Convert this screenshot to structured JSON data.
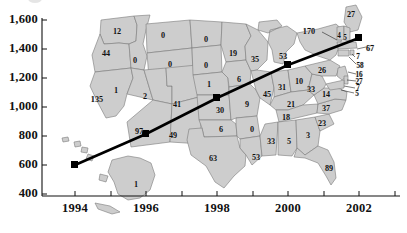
{
  "chart_data": {
    "type": "line",
    "title": "",
    "xlabel": "",
    "ylabel": "",
    "xlim": [
      1993.2,
      2003.0
    ],
    "ylim": [
      400,
      1600
    ],
    "xticks": [
      "1994",
      "1996",
      "1998",
      "2000",
      "2002"
    ],
    "xtick_values": [
      1994,
      1996,
      1998,
      2000,
      2002
    ],
    "yticks": [
      "400",
      "600",
      "800",
      "1,000",
      "1,200",
      "1,400",
      "1,600"
    ],
    "ytick_values": [
      400,
      600,
      800,
      1000,
      1200,
      1400,
      1600
    ],
    "minor_xticks": [
      1995,
      1997,
      1999,
      2001
    ],
    "grid": false,
    "legend": null,
    "marker": "filled-square",
    "line_color": "#000000",
    "series": [
      {
        "name": "trend",
        "x": [
          1994,
          1996,
          1998,
          2000,
          2002
        ],
        "values": [
          600,
          880,
          1140,
          1350,
          1510
        ]
      }
    ],
    "background_map": {
      "type": "choropleth-annotation",
      "region": "United States",
      "fill_color": "#cdcdcd",
      "border_color": "#7a7a7a",
      "state_values": [
        {
          "state": "WA",
          "value": 12
        },
        {
          "state": "OR",
          "value": 44
        },
        {
          "state": "CA",
          "value": 135
        },
        {
          "state": "NV",
          "value": 1
        },
        {
          "state": "ID",
          "value": 0
        },
        {
          "state": "MT",
          "value": 0
        },
        {
          "state": "WY",
          "value": 0
        },
        {
          "state": "UT",
          "value": 2
        },
        {
          "state": "AZ",
          "value": 97
        },
        {
          "state": "NM",
          "value": 49
        },
        {
          "state": "CO",
          "value": 41
        },
        {
          "state": "ND",
          "value": 0
        },
        {
          "state": "SD",
          "value": 0
        },
        {
          "state": "NE",
          "value": 1
        },
        {
          "state": "KS",
          "value": 30
        },
        {
          "state": "OK",
          "value": 6
        },
        {
          "state": "TX",
          "value": 63
        },
        {
          "state": "MN",
          "value": 19
        },
        {
          "state": "IA",
          "value": 6
        },
        {
          "state": "MO",
          "value": 9
        },
        {
          "state": "AR",
          "value": 0
        },
        {
          "state": "LA",
          "value": 53
        },
        {
          "state": "WI",
          "value": 35
        },
        {
          "state": "IL",
          "value": 45
        },
        {
          "state": "MS",
          "value": 33
        },
        {
          "state": "AL",
          "value": 5
        },
        {
          "state": "MI",
          "value": 53
        },
        {
          "state": "IN",
          "value": 31
        },
        {
          "state": "OH",
          "value": 10
        },
        {
          "state": "KY",
          "value": 21
        },
        {
          "state": "TN",
          "value": 18
        },
        {
          "state": "GA",
          "value": 3
        },
        {
          "state": "FL",
          "value": 89
        },
        {
          "state": "SC",
          "value": 23
        },
        {
          "state": "NC",
          "value": 37
        },
        {
          "state": "VA",
          "value": 14
        },
        {
          "state": "WV",
          "value": 33
        },
        {
          "state": "PA",
          "value": 26
        },
        {
          "state": "NY",
          "value": 170
        },
        {
          "state": "ME",
          "value": 27
        },
        {
          "state": "VT",
          "value": 4
        },
        {
          "state": "NH",
          "value": 5
        },
        {
          "state": "MA",
          "value": 67
        },
        {
          "state": "RI",
          "value": 7
        },
        {
          "state": "CT",
          "value": 58
        },
        {
          "state": "NJ",
          "value": 16
        },
        {
          "state": "DE",
          "value": 27
        },
        {
          "state": "MD",
          "value": 7
        },
        {
          "state": "DC",
          "value": 5
        },
        {
          "state": "AK",
          "value": 1
        }
      ]
    }
  },
  "axes": {
    "y_tick_labels": [
      "1,600",
      "1,400",
      "1,200",
      "1,000",
      "800",
      "600",
      "400"
    ],
    "x_tick_labels": [
      "1994",
      "1996",
      "1998",
      "2000",
      "2002"
    ]
  },
  "map_labels": [
    {
      "name": "label-wa",
      "text": "12",
      "x": 117,
      "y": 31,
      "tiny": false
    },
    {
      "name": "label-or",
      "text": "44",
      "x": 106,
      "y": 53,
      "tiny": false
    },
    {
      "name": "label-ca",
      "text": "135",
      "x": 97,
      "y": 99,
      "tiny": false
    },
    {
      "name": "label-nv",
      "text": "1",
      "x": 116,
      "y": 90,
      "tiny": false
    },
    {
      "name": "label-id",
      "text": "0",
      "x": 135,
      "y": 60,
      "tiny": false
    },
    {
      "name": "label-mt",
      "text": "0",
      "x": 163,
      "y": 35,
      "tiny": false
    },
    {
      "name": "label-wy",
      "text": "0",
      "x": 170,
      "y": 64,
      "tiny": false
    },
    {
      "name": "label-ut",
      "text": "2",
      "x": 145,
      "y": 96,
      "tiny": false
    },
    {
      "name": "label-az",
      "text": "97",
      "x": 139,
      "y": 131,
      "tiny": false
    },
    {
      "name": "label-nm",
      "text": "49",
      "x": 173,
      "y": 135,
      "tiny": false
    },
    {
      "name": "label-co",
      "text": "41",
      "x": 177,
      "y": 104,
      "tiny": false
    },
    {
      "name": "label-nd",
      "text": "0",
      "x": 206,
      "y": 39,
      "tiny": false
    },
    {
      "name": "label-sd",
      "text": "0",
      "x": 206,
      "y": 65,
      "tiny": false
    },
    {
      "name": "label-ne",
      "text": "1",
      "x": 209,
      "y": 84,
      "tiny": false
    },
    {
      "name": "label-ks",
      "text": "30",
      "x": 220,
      "y": 110,
      "tiny": false
    },
    {
      "name": "label-ok",
      "text": "6",
      "x": 221,
      "y": 129,
      "tiny": false
    },
    {
      "name": "label-tx",
      "text": "63",
      "x": 213,
      "y": 158,
      "tiny": false
    },
    {
      "name": "label-mn",
      "text": "19",
      "x": 233,
      "y": 53,
      "tiny": false
    },
    {
      "name": "label-ia",
      "text": "6",
      "x": 239,
      "y": 79,
      "tiny": false
    },
    {
      "name": "label-mo",
      "text": "9",
      "x": 247,
      "y": 104,
      "tiny": false
    },
    {
      "name": "label-ar",
      "text": "0",
      "x": 252,
      "y": 129,
      "tiny": false
    },
    {
      "name": "label-la",
      "text": "53",
      "x": 256,
      "y": 157,
      "tiny": false
    },
    {
      "name": "label-wi",
      "text": "35",
      "x": 255,
      "y": 59,
      "tiny": false
    },
    {
      "name": "label-il",
      "text": "45",
      "x": 267,
      "y": 94,
      "tiny": false
    },
    {
      "name": "label-ms",
      "text": "33",
      "x": 271,
      "y": 141,
      "tiny": false
    },
    {
      "name": "label-al",
      "text": "5",
      "x": 289,
      "y": 141,
      "tiny": false
    },
    {
      "name": "label-mi",
      "text": "53",
      "x": 283,
      "y": 56,
      "tiny": false
    },
    {
      "name": "label-in",
      "text": "31",
      "x": 282,
      "y": 87,
      "tiny": false
    },
    {
      "name": "label-oh",
      "text": "10",
      "x": 299,
      "y": 81,
      "tiny": false
    },
    {
      "name": "label-ky",
      "text": "21",
      "x": 291,
      "y": 104,
      "tiny": false
    },
    {
      "name": "label-tn",
      "text": "18",
      "x": 286,
      "y": 117,
      "tiny": false
    },
    {
      "name": "label-ga",
      "text": "3",
      "x": 308,
      "y": 135,
      "tiny": false
    },
    {
      "name": "label-fl",
      "text": "89",
      "x": 329,
      "y": 168,
      "tiny": false
    },
    {
      "name": "label-sc",
      "text": "23",
      "x": 322,
      "y": 123,
      "tiny": false
    },
    {
      "name": "label-nc",
      "text": "37",
      "x": 326,
      "y": 108,
      "tiny": false
    },
    {
      "name": "label-va",
      "text": "14",
      "x": 326,
      "y": 94,
      "tiny": false
    },
    {
      "name": "label-wv",
      "text": "33",
      "x": 311,
      "y": 89,
      "tiny": false
    },
    {
      "name": "label-pa",
      "text": "26",
      "x": 322,
      "y": 70,
      "tiny": false
    },
    {
      "name": "label-ny",
      "text": "170",
      "x": 309,
      "y": 31,
      "tiny": false
    },
    {
      "name": "label-me",
      "text": "27",
      "x": 351,
      "y": 14,
      "tiny": false
    },
    {
      "name": "label-vt",
      "text": "4",
      "x": 339,
      "y": 36,
      "tiny": true
    },
    {
      "name": "label-nh",
      "text": "5",
      "x": 345,
      "y": 38,
      "tiny": true
    },
    {
      "name": "label-ma",
      "text": "67",
      "x": 370,
      "y": 48,
      "tiny": false
    },
    {
      "name": "label-ri",
      "text": "7",
      "x": 358,
      "y": 57,
      "tiny": true
    },
    {
      "name": "label-ct",
      "text": "58",
      "x": 360,
      "y": 66,
      "tiny": true
    },
    {
      "name": "label-nj",
      "text": "16",
      "x": 359,
      "y": 75,
      "tiny": true
    },
    {
      "name": "label-de",
      "text": "27",
      "x": 359,
      "y": 82,
      "tiny": true
    },
    {
      "name": "label-md",
      "text": "7",
      "x": 358,
      "y": 88,
      "tiny": true
    },
    {
      "name": "label-dc",
      "text": "5",
      "x": 357,
      "y": 94,
      "tiny": true
    },
    {
      "name": "label-ak",
      "text": "1",
      "x": 136,
      "y": 184,
      "tiny": false
    }
  ],
  "axis_ticks": {
    "y": [
      {
        "name": "ytick-1600",
        "text": "1,600",
        "y": 20
      },
      {
        "name": "ytick-1400",
        "text": "1,400",
        "y": 49
      },
      {
        "name": "ytick-1200",
        "text": "1,200",
        "y": 78
      },
      {
        "name": "ytick-1000",
        "text": "1,000",
        "y": 107
      },
      {
        "name": "ytick-800",
        "text": "800",
        "y": 136
      },
      {
        "name": "ytick-600",
        "text": "600",
        "y": 165
      },
      {
        "name": "ytick-400",
        "text": "400",
        "y": 194
      }
    ],
    "x": [
      {
        "name": "xtick-1994",
        "text": "1994",
        "x": 75
      },
      {
        "name": "xtick-1996",
        "text": "1996",
        "x": 146
      },
      {
        "name": "xtick-1998",
        "text": "1998",
        "x": 217
      },
      {
        "name": "xtick-2000",
        "text": "2000",
        "x": 288
      },
      {
        "name": "xtick-2002",
        "text": "2002",
        "x": 359
      }
    ]
  }
}
